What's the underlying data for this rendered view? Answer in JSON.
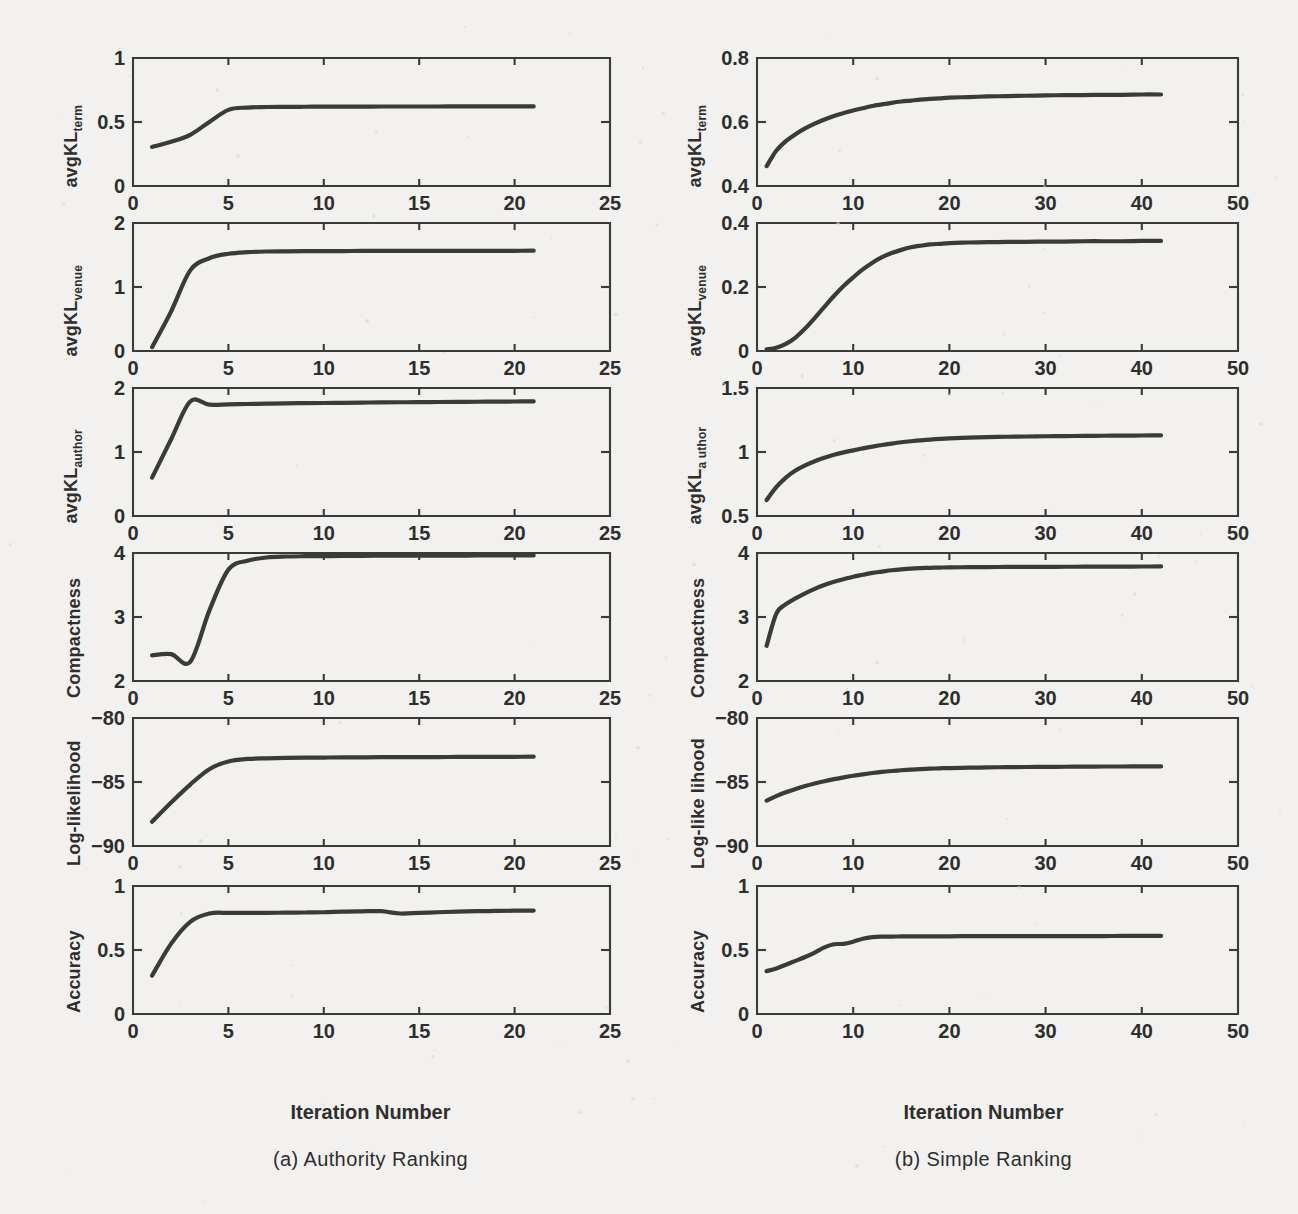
{
  "figure": {
    "xaxis_title": "Iteration Number",
    "columns": [
      {
        "id": "authority-ranking",
        "caption": "(a) Authority Ranking",
        "xlabel": "Iteration Number",
        "xlim": [
          0,
          25
        ],
        "xticks": [
          0,
          5,
          10,
          15,
          20,
          25
        ],
        "xticklabels": [
          "0",
          "5",
          "10",
          "15",
          "20",
          "25"
        ]
      },
      {
        "id": "simple-ranking",
        "caption": "(b) Simple Ranking",
        "xlabel": "Iteration Number",
        "xlim": [
          0,
          50
        ],
        "xticks": [
          0,
          10,
          20,
          30,
          40,
          50
        ],
        "xticklabels": [
          "0",
          "10",
          "20",
          "30",
          "40",
          "50"
        ]
      }
    ]
  },
  "chart_data": [
    {
      "type": "line",
      "panel": "a1",
      "column": "authority-ranking",
      "title": "",
      "ylabel": "avgKL",
      "ylabel_sub": "term",
      "xlabel": "Iteration Number",
      "xlim": [
        0,
        25
      ],
      "ylim": [
        0,
        1
      ],
      "xticks": [
        0,
        5,
        10,
        15,
        20,
        25
      ],
      "yticks": [
        0,
        0.5,
        1
      ],
      "yticklabels": [
        "0",
        "0.5",
        "1"
      ],
      "grid": false,
      "legend": "none",
      "x": [
        1,
        2,
        3,
        4,
        5,
        6,
        7,
        8,
        9,
        10,
        11,
        12,
        13,
        14,
        15,
        16,
        17,
        18,
        19,
        20,
        21
      ],
      "values": [
        0.305,
        0.345,
        0.4,
        0.5,
        0.595,
        0.613,
        0.617,
        0.618,
        0.619,
        0.62,
        0.62,
        0.62,
        0.621,
        0.621,
        0.621,
        0.621,
        0.622,
        0.622,
        0.622,
        0.622,
        0.622
      ]
    },
    {
      "type": "line",
      "panel": "a2",
      "column": "authority-ranking",
      "ylabel": "avgKL",
      "ylabel_sub": "venue",
      "xlabel": "Iteration Number",
      "xlim": [
        0,
        25
      ],
      "ylim": [
        0,
        2
      ],
      "xticks": [
        0,
        5,
        10,
        15,
        20,
        25
      ],
      "yticks": [
        0,
        1,
        2
      ],
      "yticklabels": [
        "0",
        "1",
        "2"
      ],
      "grid": false,
      "legend": "none",
      "x": [
        1,
        2,
        3,
        4,
        5,
        6,
        7,
        8,
        9,
        10,
        11,
        12,
        13,
        14,
        15,
        16,
        17,
        18,
        19,
        20,
        21
      ],
      "values": [
        0.06,
        0.62,
        1.26,
        1.45,
        1.52,
        1.545,
        1.555,
        1.558,
        1.56,
        1.561,
        1.562,
        1.563,
        1.563,
        1.564,
        1.564,
        1.565,
        1.565,
        1.566,
        1.566,
        1.566,
        1.567
      ]
    },
    {
      "type": "line",
      "panel": "a3",
      "column": "authority-ranking",
      "ylabel": "avgKL",
      "ylabel_sub": "author",
      "xlabel": "Iteration Number",
      "xlim": [
        0,
        25
      ],
      "ylim": [
        0,
        2
      ],
      "xticks": [
        0,
        5,
        10,
        15,
        20,
        25
      ],
      "yticks": [
        0,
        1,
        2
      ],
      "yticklabels": [
        "0",
        "1",
        "2"
      ],
      "grid": false,
      "legend": "none",
      "x": [
        1,
        2,
        3,
        4,
        5,
        6,
        7,
        8,
        9,
        10,
        11,
        12,
        13,
        14,
        15,
        16,
        17,
        18,
        19,
        20,
        21
      ],
      "values": [
        0.6,
        1.2,
        1.79,
        1.74,
        1.745,
        1.75,
        1.755,
        1.76,
        1.763,
        1.766,
        1.769,
        1.772,
        1.775,
        1.777,
        1.779,
        1.781,
        1.783,
        1.785,
        1.787,
        1.789,
        1.79
      ]
    },
    {
      "type": "line",
      "panel": "a4",
      "column": "authority-ranking",
      "ylabel": "Compactness",
      "ylabel_sub": "",
      "xlabel": "Iteration Number",
      "xlim": [
        0,
        25
      ],
      "ylim": [
        2,
        4
      ],
      "xticks": [
        0,
        5,
        10,
        15,
        20,
        25
      ],
      "yticks": [
        2,
        3,
        4
      ],
      "yticklabels": [
        "2",
        "3",
        "4"
      ],
      "grid": false,
      "legend": "none",
      "x": [
        1,
        2,
        3,
        4,
        5,
        6,
        7,
        8,
        9,
        10,
        11,
        12,
        13,
        14,
        15,
        16,
        17,
        18,
        19,
        20,
        21
      ],
      "values": [
        2.4,
        2.42,
        2.3,
        3.1,
        3.74,
        3.88,
        3.93,
        3.945,
        3.95,
        3.952,
        3.954,
        3.956,
        3.957,
        3.958,
        3.959,
        3.96,
        3.96,
        3.961,
        3.961,
        3.962,
        3.962
      ]
    },
    {
      "type": "line",
      "panel": "a5",
      "column": "authority-ranking",
      "ylabel": "Log-likelihood",
      "ylabel_sub": "",
      "xlabel": "Iteration Number",
      "xlim": [
        0,
        25
      ],
      "ylim": [
        -90,
        -80
      ],
      "xticks": [
        0,
        5,
        10,
        15,
        20,
        25
      ],
      "yticks": [
        -90,
        -85,
        -80
      ],
      "yticklabels": [
        "-90",
        "-85",
        "-80"
      ],
      "grid": false,
      "legend": "none",
      "x": [
        1,
        2,
        3,
        4,
        5,
        6,
        7,
        8,
        9,
        10,
        11,
        12,
        13,
        14,
        15,
        16,
        17,
        18,
        19,
        20,
        21
      ],
      "values": [
        -88.1,
        -86.6,
        -85.2,
        -84.0,
        -83.4,
        -83.2,
        -83.15,
        -83.12,
        -83.1,
        -83.09,
        -83.08,
        -83.07,
        -83.06,
        -83.06,
        -83.05,
        -83.05,
        -83.04,
        -83.04,
        -83.03,
        -83.03,
        -83.02
      ]
    },
    {
      "type": "line",
      "panel": "a6",
      "column": "authority-ranking",
      "ylabel": "Accuracy",
      "ylabel_sub": "",
      "xlabel": "Iteration Number",
      "xlim": [
        0,
        25
      ],
      "ylim": [
        0,
        1
      ],
      "xticks": [
        0,
        5,
        10,
        15,
        20,
        25
      ],
      "yticks": [
        0,
        0.5,
        1
      ],
      "yticklabels": [
        "0",
        "0.5",
        "1"
      ],
      "grid": false,
      "legend": "none",
      "x": [
        1,
        2,
        3,
        4,
        5,
        6,
        7,
        8,
        9,
        10,
        11,
        12,
        13,
        14,
        15,
        16,
        17,
        18,
        19,
        20,
        21
      ],
      "values": [
        0.3,
        0.55,
        0.72,
        0.785,
        0.79,
        0.79,
        0.79,
        0.792,
        0.793,
        0.795,
        0.8,
        0.802,
        0.803,
        0.785,
        0.79,
        0.795,
        0.8,
        0.803,
        0.805,
        0.807,
        0.808
      ]
    },
    {
      "type": "line",
      "panel": "b1",
      "column": "simple-ranking",
      "ylabel": "avgKL",
      "ylabel_sub": "term",
      "xlabel": "Iteration Number",
      "xlim": [
        0,
        50
      ],
      "ylim": [
        0.4,
        0.8
      ],
      "xticks": [
        0,
        10,
        20,
        30,
        40,
        50
      ],
      "yticks": [
        0.4,
        0.6,
        0.8
      ],
      "yticklabels": [
        "0.4",
        "0.6",
        "0.8"
      ],
      "grid": false,
      "legend": "none",
      "x": [
        1,
        2,
        3,
        4,
        5,
        6,
        7,
        8,
        9,
        10,
        11,
        12,
        13,
        14,
        15,
        16,
        17,
        18,
        19,
        20,
        22,
        24,
        26,
        28,
        30,
        32,
        34,
        36,
        38,
        40,
        42
      ],
      "values": [
        0.462,
        0.51,
        0.54,
        0.562,
        0.58,
        0.595,
        0.608,
        0.619,
        0.628,
        0.636,
        0.643,
        0.65,
        0.655,
        0.66,
        0.664,
        0.667,
        0.67,
        0.672,
        0.674,
        0.676,
        0.678,
        0.68,
        0.681,
        0.682,
        0.683,
        0.684,
        0.684,
        0.685,
        0.685,
        0.686,
        0.686
      ]
    },
    {
      "type": "line",
      "panel": "b2",
      "column": "simple-ranking",
      "ylabel": "avgKL",
      "ylabel_sub": "venue",
      "xlabel": "Iteration Number",
      "xlim": [
        0,
        50
      ],
      "ylim": [
        0,
        0.4
      ],
      "xticks": [
        0,
        10,
        20,
        30,
        40,
        50
      ],
      "yticks": [
        0,
        0.2,
        0.4
      ],
      "yticklabels": [
        "0",
        "0.2",
        "0.4"
      ],
      "grid": false,
      "legend": "none",
      "x": [
        1,
        2,
        3,
        4,
        5,
        6,
        7,
        8,
        9,
        10,
        11,
        12,
        13,
        14,
        15,
        16,
        17,
        18,
        19,
        20,
        22,
        24,
        26,
        28,
        30,
        32,
        34,
        36,
        38,
        40,
        42
      ],
      "values": [
        0.005,
        0.01,
        0.022,
        0.042,
        0.07,
        0.103,
        0.138,
        0.172,
        0.203,
        0.23,
        0.255,
        0.276,
        0.293,
        0.306,
        0.316,
        0.324,
        0.329,
        0.333,
        0.335,
        0.337,
        0.339,
        0.34,
        0.341,
        0.341,
        0.342,
        0.342,
        0.343,
        0.343,
        0.343,
        0.344,
        0.344
      ]
    },
    {
      "type": "line",
      "panel": "b3",
      "column": "simple-ranking",
      "ylabel": "avgKL",
      "ylabel_sub": "a uthor",
      "xlabel": "Iteration Number",
      "xlim": [
        0,
        50
      ],
      "ylim": [
        0.5,
        1.5
      ],
      "xticks": [
        0,
        10,
        20,
        30,
        40,
        50
      ],
      "yticks": [
        0.5,
        1,
        1.5
      ],
      "yticklabels": [
        "0.5",
        "1",
        "1.5"
      ],
      "grid": false,
      "legend": "none",
      "x": [
        1,
        2,
        3,
        4,
        5,
        6,
        7,
        8,
        9,
        10,
        11,
        12,
        13,
        14,
        15,
        16,
        17,
        18,
        19,
        20,
        22,
        24,
        26,
        28,
        30,
        32,
        34,
        36,
        38,
        40,
        42
      ],
      "values": [
        0.625,
        0.725,
        0.8,
        0.855,
        0.895,
        0.928,
        0.955,
        0.978,
        0.997,
        1.013,
        1.028,
        1.042,
        1.055,
        1.066,
        1.076,
        1.084,
        1.091,
        1.097,
        1.102,
        1.106,
        1.112,
        1.116,
        1.119,
        1.121,
        1.123,
        1.124,
        1.126,
        1.127,
        1.128,
        1.129,
        1.13
      ]
    },
    {
      "type": "line",
      "panel": "b4",
      "column": "simple-ranking",
      "ylabel": "Compactness",
      "ylabel_sub": "",
      "xlabel": "Iteration Number",
      "xlim": [
        0,
        50
      ],
      "ylim": [
        2,
        4
      ],
      "xticks": [
        0,
        10,
        20,
        30,
        40,
        50
      ],
      "yticks": [
        2,
        3,
        4
      ],
      "yticklabels": [
        "2",
        "3",
        "4"
      ],
      "grid": false,
      "legend": "none",
      "x": [
        1,
        2,
        3,
        4,
        5,
        6,
        7,
        8,
        9,
        10,
        11,
        12,
        13,
        14,
        15,
        16,
        17,
        18,
        19,
        20,
        22,
        24,
        26,
        28,
        30,
        32,
        34,
        36,
        38,
        40,
        42
      ],
      "values": [
        2.55,
        3.05,
        3.2,
        3.29,
        3.37,
        3.44,
        3.5,
        3.55,
        3.59,
        3.63,
        3.66,
        3.69,
        3.71,
        3.73,
        3.745,
        3.757,
        3.764,
        3.769,
        3.772,
        3.775,
        3.778,
        3.78,
        3.782,
        3.783,
        3.784,
        3.785,
        3.786,
        3.787,
        3.788,
        3.789,
        3.79
      ]
    },
    {
      "type": "line",
      "panel": "b5",
      "column": "simple-ranking",
      "ylabel": "Log-like lihood",
      "ylabel_sub": "",
      "xlabel": "Iteration Number",
      "xlim": [
        0,
        50
      ],
      "ylim": [
        -90,
        -80
      ],
      "xticks": [
        0,
        10,
        20,
        30,
        40,
        50
      ],
      "yticks": [
        -90,
        -85,
        -80
      ],
      "yticklabels": [
        "-90",
        "-85",
        "-80"
      ],
      "grid": false,
      "legend": "none",
      "x": [
        1,
        2,
        3,
        4,
        5,
        6,
        7,
        8,
        9,
        10,
        11,
        12,
        13,
        14,
        15,
        16,
        17,
        18,
        19,
        20,
        22,
        24,
        26,
        28,
        30,
        32,
        34,
        36,
        38,
        40,
        42
      ],
      "values": [
        -86.45,
        -86.1,
        -85.8,
        -85.55,
        -85.32,
        -85.12,
        -84.94,
        -84.78,
        -84.64,
        -84.51,
        -84.4,
        -84.3,
        -84.21,
        -84.14,
        -84.08,
        -84.03,
        -83.99,
        -83.96,
        -83.93,
        -83.91,
        -83.88,
        -83.86,
        -83.84,
        -83.83,
        -83.82,
        -83.81,
        -83.8,
        -83.79,
        -83.79,
        -83.78,
        -83.78
      ]
    },
    {
      "type": "line",
      "panel": "b6",
      "column": "simple-ranking",
      "ylabel": "Accuracy",
      "ylabel_sub": "",
      "xlabel": "Iteration Number",
      "xlim": [
        0,
        50
      ],
      "ylim": [
        0,
        1
      ],
      "xticks": [
        0,
        10,
        20,
        30,
        40,
        50
      ],
      "yticks": [
        0,
        0.5,
        1
      ],
      "yticklabels": [
        "0",
        "0.5",
        "1"
      ],
      "grid": false,
      "legend": "none",
      "x": [
        1,
        2,
        3,
        4,
        5,
        6,
        7,
        8,
        9,
        10,
        11,
        12,
        13,
        14,
        15,
        16,
        17,
        18,
        19,
        20,
        22,
        24,
        26,
        28,
        30,
        32,
        34,
        36,
        38,
        40,
        42
      ],
      "values": [
        0.335,
        0.355,
        0.385,
        0.415,
        0.445,
        0.48,
        0.52,
        0.545,
        0.548,
        0.565,
        0.588,
        0.6,
        0.604,
        0.605,
        0.606,
        0.606,
        0.606,
        0.607,
        0.607,
        0.607,
        0.608,
        0.608,
        0.608,
        0.608,
        0.609,
        0.609,
        0.609,
        0.609,
        0.61,
        0.61,
        0.61
      ]
    }
  ]
}
